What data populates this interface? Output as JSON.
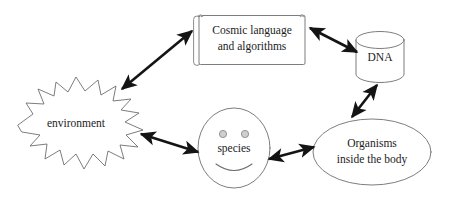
{
  "diagram": {
    "background_color": "#ffffff",
    "outline_color": "#6e6e6e",
    "arrow_color": "#141414",
    "text_color": "#1c1c1c",
    "nodes": [
      {
        "id": "environment",
        "label": "environment",
        "shape": "starburst",
        "x": 75,
        "y": 124
      },
      {
        "id": "cosmic",
        "label_line1": "Cosmic language",
        "label_line2": "and algorithms",
        "shape": "document-scroll",
        "x": 250,
        "y": 40
      },
      {
        "id": "dna",
        "label": "DNA",
        "shape": "cylinder",
        "x": 380,
        "y": 58
      },
      {
        "id": "species",
        "label": "species",
        "shape": "smiley-face",
        "x": 234,
        "y": 147
      },
      {
        "id": "organisms",
        "label_line1": "Organisms",
        "label_line2": "inside the body",
        "shape": "ellipse",
        "x": 372,
        "y": 152
      }
    ],
    "connectors": [
      {
        "id": "environment-cosmic",
        "from": "environment",
        "to": "cosmic",
        "style": "double-headed-arrow"
      },
      {
        "id": "cosmic-dna",
        "from": "cosmic",
        "to": "dna",
        "style": "double-headed-arrow"
      },
      {
        "id": "dna-organisms",
        "from": "dna",
        "to": "organisms",
        "style": "double-headed-arrow"
      },
      {
        "id": "species-organisms",
        "from": "species",
        "to": "organisms",
        "style": "double-headed-arrow"
      },
      {
        "id": "environment-species",
        "from": "environment",
        "to": "species",
        "style": "double-headed-arrow"
      }
    ]
  }
}
